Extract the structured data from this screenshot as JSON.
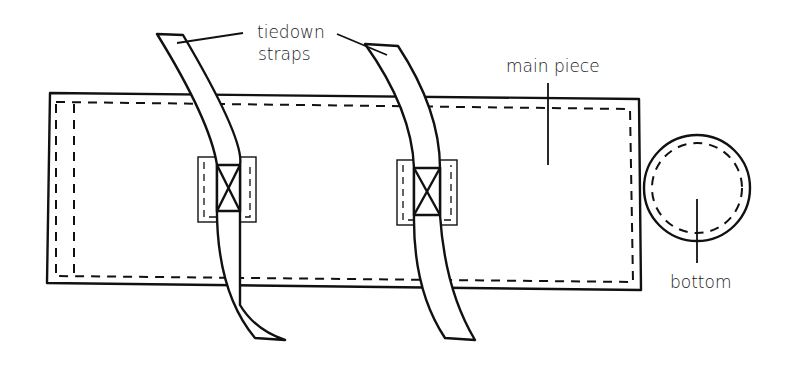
{
  "diagram": {
    "type": "sewing-pattern-diagram",
    "labels": {
      "straps": [
        "tiedown",
        "straps"
      ],
      "main_piece": "main piece",
      "bottom": "bottom"
    },
    "parts": [
      {
        "name": "main piece",
        "shape": "rectangle",
        "seam_allowance": "dashed"
      },
      {
        "name": "tiedown strap left",
        "shape": "curved strap",
        "attachment": "box-x stitch with patch"
      },
      {
        "name": "tiedown strap right",
        "shape": "curved strap",
        "attachment": "box-x stitch with patch"
      },
      {
        "name": "bottom",
        "shape": "circle",
        "seam_allowance": "dashed"
      }
    ],
    "colors": {
      "ink": "#111111",
      "background": "#ffffff"
    }
  }
}
